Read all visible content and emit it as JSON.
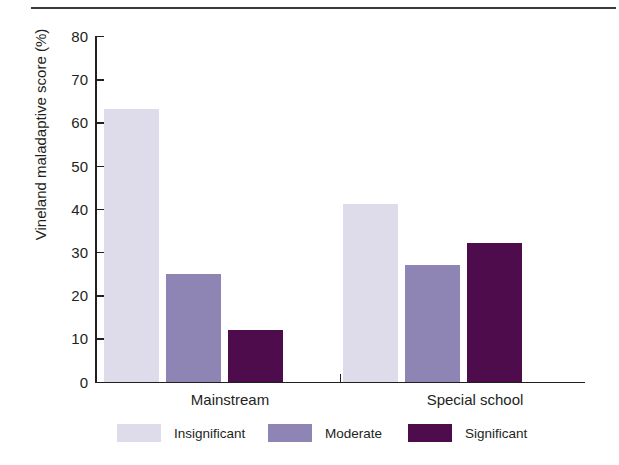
{
  "chart_data": {
    "type": "bar",
    "title": "",
    "xlabel": "",
    "ylabel": "Vineland maladaptive score (%)",
    "ylim": [
      0,
      80
    ],
    "ytick_values": [
      0,
      10,
      20,
      30,
      40,
      50,
      60,
      70,
      80
    ],
    "ytick_labels": [
      "0",
      "10",
      "20",
      "30",
      "40",
      "50",
      "60",
      "70",
      "80"
    ],
    "grid": false,
    "legend_position": "bottom",
    "categories": [
      "Mainstream",
      "Special school"
    ],
    "series": [
      {
        "name": "Insignificant",
        "color": "#dedcea",
        "values": [
          63,
          41
        ]
      },
      {
        "name": "Moderate",
        "color": "#8e85b5",
        "values": [
          25,
          27
        ]
      },
      {
        "name": "Significant",
        "color": "#4e0c4c",
        "values": [
          12,
          32
        ]
      }
    ]
  },
  "axis": {
    "y_title": "Vineland maladaptive score (%)"
  },
  "groups": [
    {
      "label": "Mainstream"
    },
    {
      "label": "Special school"
    }
  ],
  "legend": [
    {
      "label": "Insignificant",
      "color": "#dedcea"
    },
    {
      "label": "Moderate",
      "color": "#8e85b5"
    },
    {
      "label": "Significant",
      "color": "#4e0c4c"
    }
  ]
}
